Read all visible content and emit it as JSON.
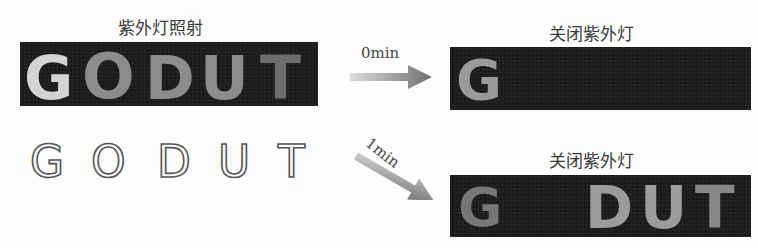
{
  "left": {
    "top_caption": "紫外灯照射",
    "glowing_letters": [
      "G",
      "O",
      "D",
      "U",
      "T"
    ],
    "outline_letters": [
      "G",
      "O",
      "D",
      "U",
      "T"
    ]
  },
  "arrows": [
    {
      "label": "0min",
      "direction": "right"
    },
    {
      "label": "1min",
      "direction": "down-right"
    }
  ],
  "right": {
    "top": {
      "caption": "关闭紫外灯",
      "visible_letters": [
        "G"
      ]
    },
    "bottom": {
      "caption": "关闭紫外灯",
      "visible_letters": [
        "G",
        "D",
        "U",
        "T"
      ]
    }
  },
  "colors": {
    "panel_bg": "#1f1f1f",
    "glow": "#8c8c8c",
    "arrow": "#777777"
  }
}
